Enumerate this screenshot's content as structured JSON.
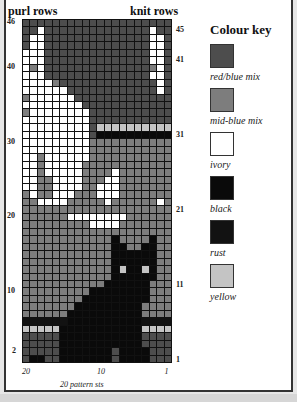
{
  "headers": {
    "left": "purl rows",
    "right": "knit rows"
  },
  "row_labels_left": [
    {
      "label": "46",
      "row": 46
    },
    {
      "label": "40",
      "row": 40
    },
    {
      "label": "30",
      "row": 30
    },
    {
      "label": "20",
      "row": 20
    },
    {
      "label": "10",
      "row": 10
    },
    {
      "label": "2",
      "row": 2
    }
  ],
  "row_labels_right": [
    {
      "label": "45",
      "row": 45
    },
    {
      "label": "41",
      "row": 41
    },
    {
      "label": "31",
      "row": 31
    },
    {
      "label": "21",
      "row": 21
    },
    {
      "label": "11",
      "row": 11
    },
    {
      "label": "1",
      "row": 1
    }
  ],
  "col_labels": [
    {
      "label": "20",
      "col": 20
    },
    {
      "label": "10",
      "col": 10
    },
    {
      "label": "1",
      "col": 1
    }
  ],
  "footer": "20 pattern sts",
  "colour_key": {
    "title": "Colour key",
    "items": [
      {
        "code": "D",
        "label": "red/blue mix",
        "color": "#4d4d4d"
      },
      {
        "code": "M",
        "label": "mid-blue mix",
        "color": "#7d7d7d"
      },
      {
        "code": "W",
        "label": "ivory",
        "color": "#ffffff"
      },
      {
        "code": "K",
        "label": "black",
        "color": "#0a0a0a"
      },
      {
        "code": "R",
        "label": "rust",
        "color": "#121212"
      },
      {
        "code": "Y",
        "label": "yellow",
        "color": "#c4c4c4"
      }
    ]
  },
  "grid": {
    "cols": 20,
    "rows": 46,
    "rows_top_to_bottom": [
      "DDDDDDDDDDDDDDDDDDDD",
      "DDWDDDDDDDDDDDDDDWDD",
      "DWWDDDDDDDDDDDDDDWWD",
      "DWWDDDDDDDDDDDDDDWWD",
      "WWWDDDDDDDDDDDDDDWWD",
      "WWWDDDDDDDDDDDDDDWWD",
      "WMWDDDDDDDDDDDDDDMWD",
      "WWWDDDDDDDDDDDDDDWWD",
      "WWWWMDDDDDDDDDDDDDWD",
      "WWWWWWDDDDDDDDDDDDWD",
      "MWWWWWWDDDDDDDDDDDDD",
      "WWWWWWWWDDDDDDDDDDDD",
      "MWWWWWWWWDDDDDDDDDDD",
      "WWWWWWWWWDDDDDDDDDDD",
      "WWWWWWWWWDYYYYYYYYYY",
      "WWWWWWWWWDKKKKKKKKKK",
      "WWWWWWWWWMMMMMMMMMMM",
      "WWWWWWWWWMMMMMMMMMMM",
      "WWMWWWWWWMMMMMMMMMMM",
      "WWMWWWWWMMMMMMMMMMMM",
      "WWMWWWWWMMMMWMMMMMMM",
      "WWMMWWWWMMMWWMMMMMMM",
      "WWMMWWWWMMWWWMMMMMMM",
      "MWMMWWWMMMWWWMMMMMMM",
      "MMWWWWMMMMMWMMMMMMWM",
      "MMMMMMMMMMMMMMMMMMMM",
      "MMMMMMWWWWWWWWMMMMMM",
      "MMMMMMMMMWWWWMMMMMMM",
      "MMMMMMMMMMMMMMMMMMMM",
      "MMMMMMMMMMMMKMMMMKMM",
      "MMMMMMMMMMMMKKMMKKMM",
      "MMMMMMMMMMMMKKKKKKMM",
      "MMMMMMMMMMMMKKKKKKMM",
      "MMMMMMMMMMMMKYKKYKMM",
      "MMMMMMMMMMMMKKKKKKMM",
      "MMMMMMMMMMMKKKKKKMMM",
      "MMMMMMMMMKKKKKKKKMMM",
      "MMMMMMMMKKKKKKKKKMMM",
      "MMMMMMMKKKKKKKKKMMMM",
      "MMMMMMKKKKKKKKKKMMMM",
      "RRRRRRKKKKKKKKKKRRRR",
      "YYYYYKKKKKKKKKKKYYYY",
      "DDDDDKKKKKKKKKKKDDDD",
      "DDDDDKKKKKKKKKKKDDDD",
      "DDDDDKKKKKKKDKKKKDDD",
      "DKKDDKKKKKKKDKKKKDDD"
    ]
  }
}
